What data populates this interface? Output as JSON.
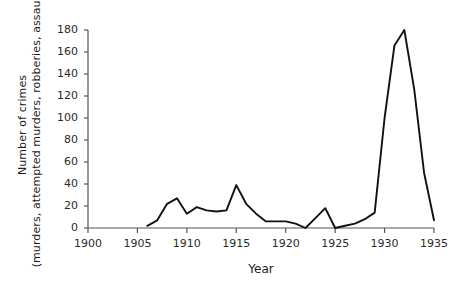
{
  "chart_data": {
    "type": "line",
    "title": "",
    "xlabel": "Year",
    "ylabel_line1": "Number of crimes",
    "ylabel_line2": "(murders, attempted murders, robberies, assaults)",
    "xlim": [
      1900,
      1935
    ],
    "ylim": [
      0,
      180
    ],
    "grid": false,
    "legend": "none",
    "line_color": "#111111",
    "axis_color": "#555555",
    "xticks": [
      1900,
      1905,
      1910,
      1915,
      1920,
      1925,
      1930,
      1935
    ],
    "xtick_labels": [
      "1900",
      "1905",
      "1910",
      "1915",
      "1920",
      "1925",
      "1930",
      "1935"
    ],
    "yticks": [
      0,
      20,
      40,
      60,
      80,
      100,
      120,
      140,
      160,
      180
    ],
    "ytick_labels": [
      "0",
      "20",
      "40",
      "60",
      "80",
      "100",
      "120",
      "140",
      "160",
      "180"
    ],
    "series": [
      {
        "name": "Number of crimes",
        "x": [
          1906,
          1907,
          1908,
          1909,
          1910,
          1911,
          1912,
          1913,
          1914,
          1915,
          1916,
          1917,
          1918,
          1919,
          1920,
          1921,
          1922,
          1923,
          1924,
          1925,
          1926,
          1927,
          1928,
          1929,
          1930,
          1931,
          1932,
          1933,
          1934,
          1935
        ],
        "values": [
          2,
          7,
          22,
          27,
          13,
          19,
          16,
          15,
          16,
          39,
          22,
          13,
          6,
          6,
          6,
          4,
          0,
          9,
          18,
          0,
          2,
          4,
          8,
          14,
          100,
          166,
          180,
          126,
          50,
          7
        ]
      }
    ]
  }
}
